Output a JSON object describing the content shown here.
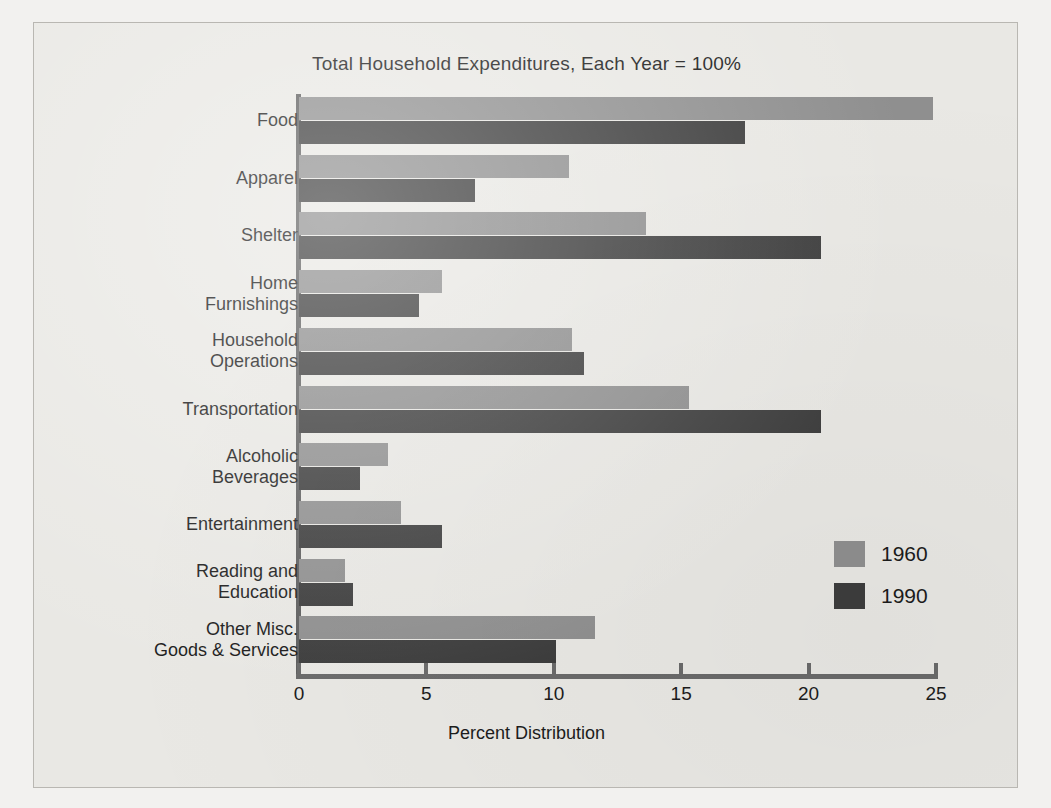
{
  "chart_data": {
    "type": "bar",
    "orientation": "horizontal",
    "title": "Total Household Expenditures, Each Year = 100%",
    "xlabel": "Percent Distribution",
    "ylabel": "",
    "xlim": [
      0,
      25
    ],
    "xticks": [
      0,
      5,
      10,
      15,
      20,
      25
    ],
    "xtick_labels": [
      "0",
      "5",
      "10",
      "15",
      "20",
      "25"
    ],
    "grid": false,
    "legend_position": "middle-right",
    "categories": [
      "Food",
      "Apparel",
      "Shelter",
      "Home\nFurnishings",
      "Household\nOperations",
      "Transportation",
      "Alcoholic\nBeverages",
      "Entertainment",
      "Reading and\nEducation",
      "Other Misc.\nGoods & Services"
    ],
    "series": [
      {
        "name": "1960",
        "color": "#8f8f8f",
        "values": [
          24.9,
          10.6,
          13.6,
          5.6,
          10.7,
          15.3,
          3.5,
          4.0,
          1.8,
          11.6
        ]
      },
      {
        "name": "1990",
        "color": "#3d3d3d",
        "values": [
          17.5,
          6.9,
          20.5,
          4.7,
          11.2,
          20.5,
          2.4,
          5.6,
          2.1,
          10.1
        ]
      }
    ]
  },
  "legend": {
    "entries": [
      {
        "label": "1960",
        "color": "#8f8f8f"
      },
      {
        "label": "1990",
        "color": "#3d3d3d"
      }
    ]
  },
  "colors": {
    "series_1960": "#8f8f8f",
    "series_1990": "#3d3d3d",
    "axis": "#6a6a6a",
    "plate_background": "#e9e8e4",
    "page_background": "#f2f1ef",
    "text": "#1c1c1c"
  }
}
